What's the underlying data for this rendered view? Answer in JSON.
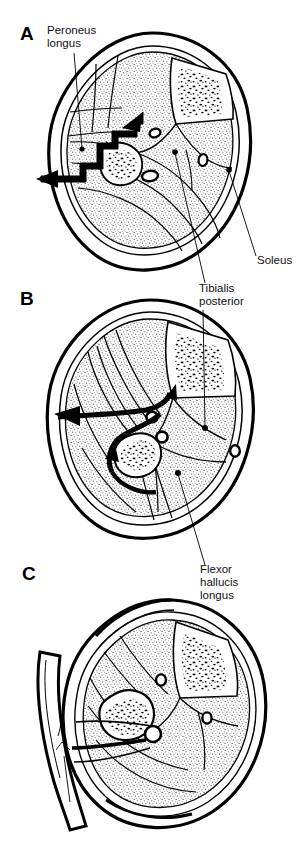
{
  "figure": {
    "kind": "anatomical-cross-section-illustration",
    "background_color": "#ffffff",
    "ink_color": "#000000",
    "muscle_fill": "stipple",
    "panel_count": 3
  },
  "panels": [
    {
      "letter": "A",
      "caption": "",
      "arrow": "straight stepped arrow entering from lateral side toward fibula",
      "structures": [
        "peroneus longus",
        "fibula",
        "tibia",
        "tibialis posterior",
        "soleus",
        "vessels"
      ]
    },
    {
      "letter": "B",
      "caption": "",
      "arrow": "curved arrow sweeping around the fibula",
      "structures": [
        "fibula",
        "tibia",
        "tibialis posterior",
        "flexor hallucis longus",
        "vessels"
      ]
    },
    {
      "letter": "C",
      "caption": "",
      "arrow": "none",
      "structures": [
        "fibula",
        "tibia",
        "vascular pedicle",
        "skin paddle flap"
      ]
    }
  ],
  "labels": [
    {
      "id": "peroneus-longus",
      "lines": [
        "Peroneus",
        "longus"
      ],
      "panel": "A",
      "anchor": "upper-left"
    },
    {
      "id": "soleus",
      "lines": [
        "Soleus"
      ],
      "panel": "A",
      "anchor": "lower-right"
    },
    {
      "id": "tibialis-posterior",
      "lines": [
        "Tibialis",
        "posterior"
      ],
      "panel": "B",
      "anchor": "upper-right"
    },
    {
      "id": "flexor-hallucis-longus",
      "lines": [
        "Flexor",
        "hallucis",
        "longus"
      ],
      "panel": "C",
      "anchor": "upper-right"
    }
  ]
}
